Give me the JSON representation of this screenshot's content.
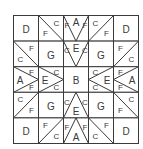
{
  "diagram": {
    "grid": {
      "rows": 5,
      "cols": 5
    },
    "line_color": "#3a3a3a",
    "cells": [
      [
        {
          "shape": "plain",
          "labels": [
            {
              "t": "D",
              "pos": "c"
            }
          ]
        },
        {
          "shape": "diag-tl-br",
          "labels": [
            {
              "t": "F",
              "pos": "bl"
            },
            {
              "t": "C",
              "pos": "tr"
            }
          ]
        },
        {
          "shape": "goose-down",
          "labels": [
            {
              "t": "F",
              "pos": "l"
            },
            {
              "t": "A",
              "pos": "tc"
            },
            {
              "t": "F",
              "pos": "r"
            }
          ]
        },
        {
          "shape": "diag-bl-tr",
          "labels": [
            {
              "t": "C",
              "pos": "tl"
            },
            {
              "t": "F",
              "pos": "br"
            }
          ]
        },
        {
          "shape": "plain",
          "labels": [
            {
              "t": "D",
              "pos": "c"
            }
          ]
        }
      ],
      [
        {
          "shape": "diag-tl-br",
          "labels": [
            {
              "t": "C",
              "pos": "bl"
            },
            {
              "t": "F",
              "pos": "tr"
            }
          ]
        },
        {
          "shape": "plain",
          "labels": [
            {
              "t": "G",
              "pos": "c"
            }
          ]
        },
        {
          "shape": "goose-down",
          "labels": [
            {
              "t": "C",
              "pos": "l"
            },
            {
              "t": "E",
              "pos": "tc"
            },
            {
              "t": "C",
              "pos": "r"
            }
          ]
        },
        {
          "shape": "plain",
          "labels": [
            {
              "t": "G",
              "pos": "c"
            }
          ]
        },
        {
          "shape": "diag-bl-tr",
          "labels": [
            {
              "t": "F",
              "pos": "tl"
            },
            {
              "t": "C",
              "pos": "br"
            }
          ]
        }
      ],
      [
        {
          "shape": "goose-right",
          "labels": [
            {
              "t": "F",
              "pos": "t"
            },
            {
              "t": "A",
              "pos": "lc"
            },
            {
              "t": "F",
              "pos": "b"
            }
          ]
        },
        {
          "shape": "goose-right",
          "labels": [
            {
              "t": "C",
              "pos": "t"
            },
            {
              "t": "E",
              "pos": "lc"
            },
            {
              "t": "C",
              "pos": "b"
            }
          ]
        },
        {
          "shape": "plain",
          "labels": [
            {
              "t": "B",
              "pos": "c"
            }
          ]
        },
        {
          "shape": "goose-left",
          "labels": [
            {
              "t": "C",
              "pos": "t"
            },
            {
              "t": "E",
              "pos": "rc"
            },
            {
              "t": "C",
              "pos": "b"
            }
          ]
        },
        {
          "shape": "goose-left",
          "labels": [
            {
              "t": "F",
              "pos": "t"
            },
            {
              "t": "A",
              "pos": "rc"
            },
            {
              "t": "F",
              "pos": "b"
            }
          ]
        }
      ],
      [
        {
          "shape": "diag-bl-tr",
          "labels": [
            {
              "t": "C",
              "pos": "tl"
            },
            {
              "t": "F",
              "pos": "br"
            }
          ]
        },
        {
          "shape": "plain",
          "labels": [
            {
              "t": "G",
              "pos": "c"
            }
          ]
        },
        {
          "shape": "goose-up",
          "labels": [
            {
              "t": "C",
              "pos": "l"
            },
            {
              "t": "E",
              "pos": "bc"
            },
            {
              "t": "C",
              "pos": "r"
            }
          ]
        },
        {
          "shape": "plain",
          "labels": [
            {
              "t": "G",
              "pos": "c"
            }
          ]
        },
        {
          "shape": "diag-tl-br",
          "labels": [
            {
              "t": "F",
              "pos": "bl"
            },
            {
              "t": "C",
              "pos": "tr"
            }
          ]
        }
      ],
      [
        {
          "shape": "plain",
          "labels": [
            {
              "t": "D",
              "pos": "c"
            }
          ]
        },
        {
          "shape": "diag-bl-tr",
          "labels": [
            {
              "t": "F",
              "pos": "tl"
            },
            {
              "t": "C",
              "pos": "br"
            }
          ]
        },
        {
          "shape": "goose-up",
          "labels": [
            {
              "t": "F",
              "pos": "l"
            },
            {
              "t": "A",
              "pos": "bc"
            },
            {
              "t": "F",
              "pos": "r"
            }
          ]
        },
        {
          "shape": "diag-tl-br",
          "labels": [
            {
              "t": "C",
              "pos": "bl"
            },
            {
              "t": "F",
              "pos": "tr"
            }
          ]
        },
        {
          "shape": "plain",
          "labels": [
            {
              "t": "D",
              "pos": "c"
            }
          ]
        }
      ]
    ]
  }
}
